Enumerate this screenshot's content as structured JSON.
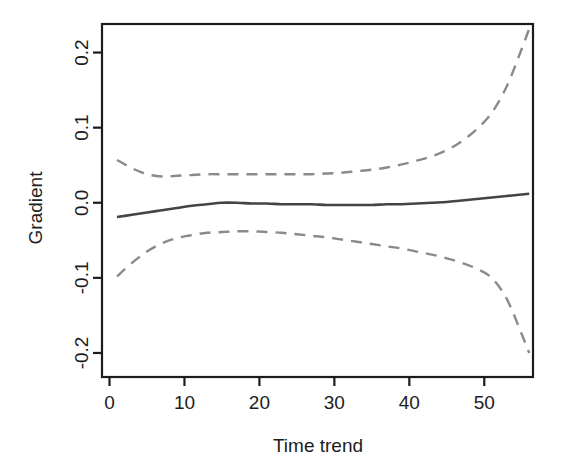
{
  "chart_data": {
    "type": "line",
    "title": "",
    "xlabel": "Time trend",
    "ylabel": "Gradient",
    "xlim": [
      -1.0,
      56.5
    ],
    "ylim": [
      -0.232,
      0.238
    ],
    "xticks": [
      0,
      10,
      20,
      30,
      40,
      50
    ],
    "xtick_labels": [
      "0",
      "10",
      "20",
      "30",
      "40",
      "50"
    ],
    "yticks": [
      -0.2,
      -0.1,
      0.0,
      0.1,
      0.2
    ],
    "ytick_labels": [
      "-0.2",
      "-0.1",
      "0.0",
      "0.1",
      "0.2"
    ],
    "grid": false,
    "legend": "none",
    "box": true,
    "series": [
      {
        "name": "Gradient estimate",
        "style": "solid",
        "color": "#444444",
        "width": 2.6,
        "x": [
          1,
          3,
          5,
          7,
          9,
          11,
          13,
          15,
          17,
          19,
          21,
          23,
          25,
          27,
          29,
          31,
          33,
          35,
          37,
          39,
          41,
          43,
          45,
          47,
          49,
          51,
          53,
          55,
          56
        ],
        "y": [
          -0.019,
          -0.016,
          -0.013,
          -0.01,
          -0.007,
          -0.004,
          -0.002,
          0.0,
          0.0,
          -0.001,
          -0.001,
          -0.002,
          -0.002,
          -0.002,
          -0.003,
          -0.003,
          -0.003,
          -0.003,
          -0.002,
          -0.002,
          -0.001,
          0.0,
          0.001,
          0.003,
          0.005,
          0.007,
          0.009,
          0.011,
          0.012
        ]
      },
      {
        "name": "Upper confidence band",
        "style": "dashed",
        "color": "#8a8a8a",
        "width": 2.4,
        "x": [
          1,
          3,
          5,
          7,
          9,
          11,
          13,
          15,
          17,
          19,
          21,
          23,
          25,
          27,
          29,
          31,
          33,
          35,
          37,
          39,
          41,
          43,
          45,
          47,
          49,
          51,
          53,
          55,
          56
        ],
        "y": [
          0.057,
          0.046,
          0.038,
          0.035,
          0.036,
          0.037,
          0.038,
          0.038,
          0.038,
          0.038,
          0.038,
          0.038,
          0.038,
          0.038,
          0.039,
          0.04,
          0.042,
          0.044,
          0.047,
          0.051,
          0.056,
          0.062,
          0.07,
          0.082,
          0.098,
          0.12,
          0.155,
          0.205,
          0.232
        ]
      },
      {
        "name": "Lower confidence band",
        "style": "dashed",
        "color": "#8a8a8a",
        "width": 2.4,
        "x": [
          1,
          3,
          5,
          7,
          9,
          11,
          13,
          15,
          17,
          19,
          21,
          23,
          25,
          27,
          29,
          31,
          33,
          35,
          37,
          39,
          41,
          43,
          45,
          47,
          49,
          51,
          53,
          55,
          56
        ],
        "y": [
          -0.098,
          -0.08,
          -0.065,
          -0.054,
          -0.047,
          -0.043,
          -0.04,
          -0.039,
          -0.038,
          -0.038,
          -0.039,
          -0.04,
          -0.042,
          -0.044,
          -0.046,
          -0.049,
          -0.052,
          -0.055,
          -0.058,
          -0.061,
          -0.065,
          -0.069,
          -0.074,
          -0.08,
          -0.088,
          -0.1,
          -0.128,
          -0.175,
          -0.2
        ]
      }
    ]
  },
  "axes": {
    "x_title": "Time trend",
    "y_title": "Gradient"
  },
  "colors": {
    "axis": "#1c1c1c",
    "solid_line": "#444444",
    "dashed_line": "#8a8a8a",
    "background": "#ffffff"
  }
}
